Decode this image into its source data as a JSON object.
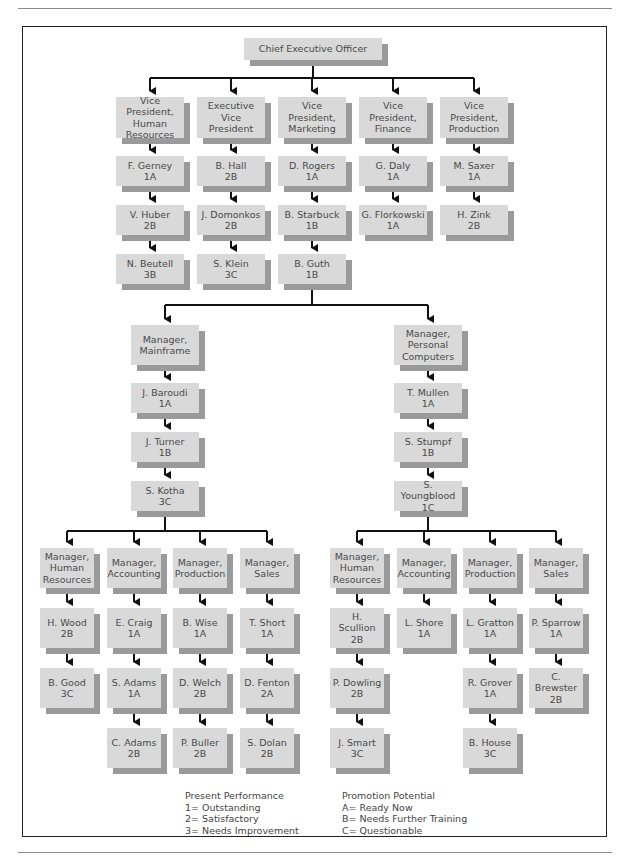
{
  "chart": {
    "ceo": {
      "title": "Chief Executive Officer"
    },
    "vps": [
      {
        "title": "Vice President,\nHuman\nResources",
        "reports": [
          {
            "name": "F. Gerney",
            "rating": "1A"
          },
          {
            "name": "V. Huber",
            "rating": "2B"
          },
          {
            "name": "N. Beutell",
            "rating": "3B"
          }
        ]
      },
      {
        "title": "Executive\nVice President",
        "reports": [
          {
            "name": "B. Hall",
            "rating": "2B"
          },
          {
            "name": "J. Domonkos",
            "rating": "2B"
          },
          {
            "name": "S. Klein",
            "rating": "3C"
          }
        ]
      },
      {
        "title": "Vice President,\nMarketing",
        "reports": [
          {
            "name": "D. Rogers",
            "rating": "1A"
          },
          {
            "name": "B. Starbuck",
            "rating": "1B"
          },
          {
            "name": "B. Guth",
            "rating": "1B"
          }
        ]
      },
      {
        "title": "Vice President,\nFinance",
        "reports": [
          {
            "name": "G. Daly",
            "rating": "1A"
          },
          {
            "name": "G. Florkowski",
            "rating": "1A"
          }
        ]
      },
      {
        "title": "Vice President,\nProduction",
        "reports": [
          {
            "name": "M. Saxer",
            "rating": "1A"
          },
          {
            "name": "H. Zink",
            "rating": "2B"
          }
        ]
      }
    ],
    "divisions": [
      {
        "title": "Manager,\nMainframe",
        "chain": [
          {
            "name": "J. Baroudi",
            "rating": "1A"
          },
          {
            "name": "J. Turner",
            "rating": "1B"
          },
          {
            "name": "S. Kotha",
            "rating": "3C"
          }
        ],
        "departments": [
          {
            "title": "Manager,\nHuman\nResources",
            "staff": [
              {
                "name": "H. Wood",
                "rating": "2B"
              },
              {
                "name": "B. Good",
                "rating": "3C"
              }
            ]
          },
          {
            "title": "Manager,\nAccounting",
            "staff": [
              {
                "name": "E. Craig",
                "rating": "1A"
              },
              {
                "name": "S. Adams",
                "rating": "1A"
              },
              {
                "name": "C. Adams",
                "rating": "2B"
              }
            ]
          },
          {
            "title": "Manager,\nProduction",
            "staff": [
              {
                "name": "B. Wise",
                "rating": "1A"
              },
              {
                "name": "D. Welch",
                "rating": "2B"
              },
              {
                "name": "P. Buller",
                "rating": "2B"
              }
            ]
          },
          {
            "title": "Manager,\nSales",
            "staff": [
              {
                "name": "T. Short",
                "rating": "1A"
              },
              {
                "name": "D. Fenton",
                "rating": "2A"
              },
              {
                "name": "S. Dolan",
                "rating": "2B"
              }
            ]
          }
        ]
      },
      {
        "title": "Manager,\nPersonal\nComputers",
        "chain": [
          {
            "name": "T. Mullen",
            "rating": "1A"
          },
          {
            "name": "S. Stumpf",
            "rating": "1B"
          },
          {
            "name": "S. Youngblood",
            "rating": "1C"
          }
        ],
        "departments": [
          {
            "title": "Manager,\nHuman\nResources",
            "staff": [
              {
                "name": "H. Scullion",
                "rating": "2B"
              },
              {
                "name": "P. Dowling",
                "rating": "2B"
              },
              {
                "name": "J. Smart",
                "rating": "3C"
              }
            ]
          },
          {
            "title": "Manager,\nAccounting",
            "staff": [
              {
                "name": "L. Shore",
                "rating": "1A"
              }
            ]
          },
          {
            "title": "Manager,\nProduction",
            "staff": [
              {
                "name": "L. Gratton",
                "rating": "1A"
              },
              {
                "name": "R. Grover",
                "rating": "1A"
              },
              {
                "name": "B. House",
                "rating": "3C"
              }
            ]
          },
          {
            "title": "Manager,\nSales",
            "staff": [
              {
                "name": "P. Sparrow",
                "rating": "1A"
              },
              {
                "name": "C. Brewster",
                "rating": "2B"
              }
            ]
          }
        ]
      }
    ]
  },
  "legend": {
    "performance": {
      "heading": "Present Performance",
      "items": [
        "1= Outstanding",
        "2= Satisfactory",
        "3= Needs Improvement"
      ]
    },
    "potential": {
      "heading": "Promotion Potential",
      "items": [
        "A= Ready Now",
        "B= Needs Further Training",
        "C= Questionable"
      ]
    }
  },
  "colors": {
    "box_fill": "#d9d9d9",
    "box_shadow": "#9a9a9a",
    "line": "#111111",
    "frame": "#222222"
  }
}
